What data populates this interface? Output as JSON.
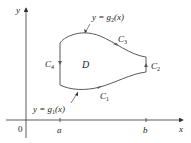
{
  "diagram": {
    "title": "",
    "axes": {
      "x_label": "x",
      "y_label": "y",
      "origin_label": "0",
      "ticks": [
        {
          "label": "a",
          "x": 60
        },
        {
          "label": "b",
          "x": 146
        }
      ]
    },
    "region": {
      "label": "D",
      "boundary": [
        {
          "id": "C1",
          "name": "C",
          "sub": "1",
          "description": "bottom curve, oriented left to right"
        },
        {
          "id": "C2",
          "name": "C",
          "sub": "2",
          "description": "right vertical segment x=b, oriented upward"
        },
        {
          "id": "C3",
          "name": "C",
          "sub": "3",
          "description": "top curve, oriented right to left"
        },
        {
          "id": "C4",
          "name": "C",
          "sub": "4",
          "description": "left vertical segment x=a, oriented downward"
        }
      ]
    },
    "curve_labels": {
      "upper": {
        "prefix": "y = g",
        "sub": "2",
        "suffix": "(x)"
      },
      "lower": {
        "prefix": "y = g",
        "sub": "1",
        "suffix": "(x)"
      }
    },
    "colors": {
      "axis": "#333333",
      "curve": "#5a5a5a",
      "text": "#222222"
    }
  }
}
